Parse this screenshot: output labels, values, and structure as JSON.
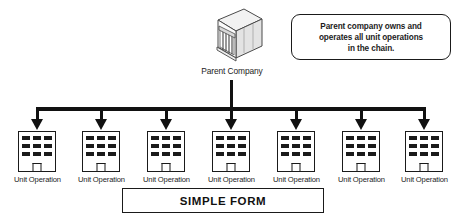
{
  "diagram": {
    "callout": {
      "lines": [
        "Parent company owns and",
        "operates all unit operations",
        "in the chain."
      ],
      "text": "Parent company owns and operates all unit operations in the chain."
    },
    "parent": {
      "label": "Parent Company",
      "icon": "isometric-office-building-icon"
    },
    "units": [
      {
        "label": "Unit Operation"
      },
      {
        "label": "Unit Operation"
      },
      {
        "label": "Unit Operation"
      },
      {
        "label": "Unit Operation"
      },
      {
        "label": "Unit Operation"
      },
      {
        "label": "Unit Operation"
      },
      {
        "label": "Unit Operation"
      }
    ],
    "footer": {
      "caption": "SIMPLE FORM"
    },
    "colors": {
      "line": "#111111",
      "text": "#1c1c1c",
      "background": "#ffffff",
      "window": "#1a1a1a"
    }
  }
}
